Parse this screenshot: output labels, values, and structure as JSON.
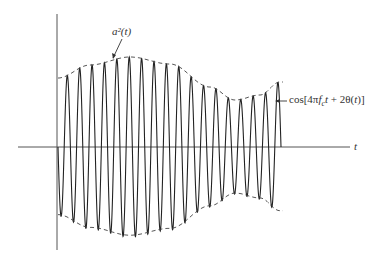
{
  "figure": {
    "envelope_label": "a²(t)",
    "carrier_label": "cos[4πf_c t + 2θ(t)]",
    "carrier_label_parts": {
      "pre": "cos[4π",
      "f": "f",
      "sub": "c",
      "t": "t",
      "post": " + 2θ(",
      "t2": "t",
      "end": ")]"
    },
    "axis_label_t": "t"
  },
  "chart_data": {
    "type": "line",
    "title": "",
    "xlabel": "t",
    "ylabel": "",
    "series": [
      {
        "name": "envelope a²(t) (upper, px y above axis)",
        "x": [
          58,
          90,
          130,
          170,
          210,
          235,
          260,
          280
        ],
        "values": [
          69,
          82,
          90,
          83,
          60,
          47,
          52,
          65
        ]
      },
      {
        "name": "carrier cycles",
        "values": [
          18
        ]
      }
    ],
    "legend": [],
    "annotations": [
      "a²(t)",
      "cos[4πf_c t + 2θ(t)]",
      "t"
    ],
    "grid": false
  }
}
